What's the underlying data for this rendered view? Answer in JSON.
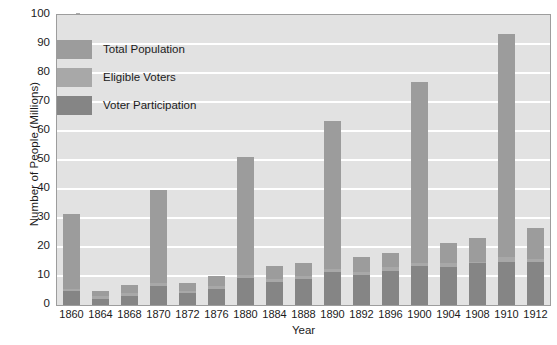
{
  "chart_data": {
    "type": "bar",
    "subtype": "stacked-bar",
    "title": "",
    "xlabel": "Year",
    "ylabel": "Number of People (Millions)",
    "ylim": [
      0,
      100
    ],
    "ytick_step": 10,
    "yticks": [
      0,
      10,
      20,
      30,
      40,
      50,
      60,
      70,
      80,
      90,
      100
    ],
    "grid": "horizontal",
    "legend_position": "upper-left-inside",
    "categories": [
      "1860",
      "1864",
      "1868",
      "1870",
      "1872",
      "1876",
      "1880",
      "1884",
      "1888",
      "1890",
      "1892",
      "1896",
      "1900",
      "1904",
      "1908",
      "1910",
      "1912"
    ],
    "series": [
      {
        "name": "Total Population",
        "color": "#9c9c9c",
        "values": [
          31.4,
          5.0,
          7.0,
          39.8,
          7.5,
          10.0,
          50.9,
          13.5,
          14.5,
          63.5,
          16.5,
          18.0,
          77.0,
          21.5,
          23.0,
          93.5,
          26.5
        ]
      },
      {
        "name": "Eligible Voters",
        "color": "#a8a8a8",
        "values": [
          5.5,
          3.0,
          4.0,
          7.5,
          5.0,
          6.5,
          10.5,
          9.0,
          10.0,
          12.5,
          11.5,
          13.0,
          14.5,
          14.5,
          15.0,
          16.5,
          16.0
        ]
      },
      {
        "name": "Voter Participation",
        "color": "#858585",
        "values": [
          4.7,
          2.2,
          3.2,
          6.5,
          4.0,
          5.5,
          9.2,
          8.0,
          9.0,
          11.4,
          10.5,
          11.8,
          13.5,
          13.0,
          14.5,
          15.0,
          15.0
        ]
      }
    ]
  },
  "colors": {
    "plot_background": "#e2e2e2",
    "gridline": "#ffffff",
    "axis_border": "#9d9d9d",
    "text": "#1b1b1b",
    "bar_light": "#9c9c9c",
    "bar_mid": "#a8a8a8",
    "bar_dark": "#858585",
    "page_background": "#ffffff"
  }
}
